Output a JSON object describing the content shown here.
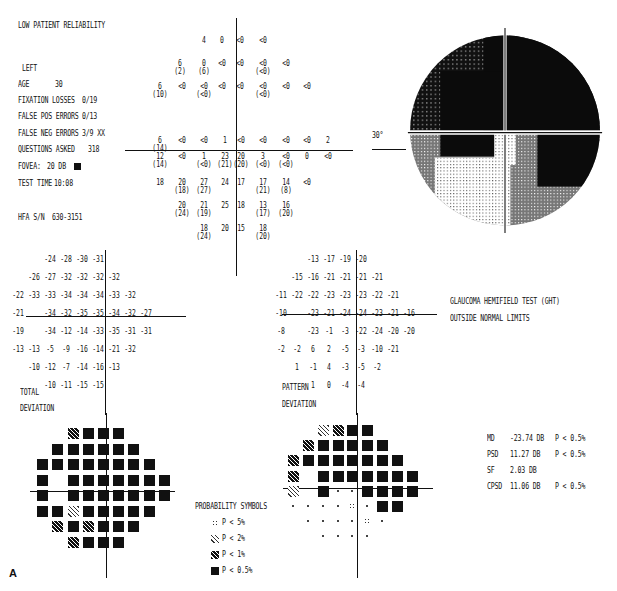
{
  "header": {
    "reliability": "LOW PATIENT RELIABILITY",
    "eye": "LEFT",
    "age_label": "AGE",
    "age": "30",
    "fixation_label": "FIXATION LOSSES",
    "fixation": "0/19",
    "falsepos_label": "FALSE POS ERRORS",
    "falsepos": "0/13",
    "falseneg_label": "FALSE NEG ERRORS",
    "falseneg": "3/9 XX",
    "questions_label": "QUESTIONS ASKED",
    "questions": "318",
    "fovea_label": "FOVEA:",
    "fovea": "20 DB",
    "testtime_label": "TEST TIME",
    "testtime": "10:08",
    "serial_label": "HFA S/N",
    "serial": "630-3151"
  },
  "grayscale": {
    "degree_label": "30°"
  },
  "threshold_rows": [
    {
      "y": 37,
      "cells": [
        {
          "x": 204,
          "v": "4"
        },
        {
          "x": 222,
          "v": "0"
        },
        {
          "x": 240,
          "v": "<0"
        },
        {
          "x": 263,
          "v": "<0"
        }
      ]
    },
    {
      "y": 60,
      "cells": [
        {
          "x": 180,
          "v": "6",
          "p": "(2)"
        },
        {
          "x": 204,
          "v": "0",
          "p": "(6)"
        },
        {
          "x": 222,
          "v": "<0"
        },
        {
          "x": 240,
          "v": "<0"
        },
        {
          "x": 263,
          "v": "<0",
          "p": "(<0)"
        },
        {
          "x": 286,
          "v": "<0"
        }
      ]
    },
    {
      "y": 83,
      "cells": [
        {
          "x": 160,
          "v": "6",
          "p": "(10)"
        },
        {
          "x": 182,
          "v": "<0"
        },
        {
          "x": 204,
          "v": "<0",
          "p": "(<0)"
        },
        {
          "x": 222,
          "v": "<0"
        },
        {
          "x": 240,
          "v": "<0"
        },
        {
          "x": 263,
          "v": "<0",
          "p": "(<0)"
        },
        {
          "x": 286,
          "v": "<0"
        },
        {
          "x": 307,
          "v": "<0"
        }
      ]
    },
    {
      "y": 137,
      "cells": [
        {
          "x": 160,
          "v": "6",
          "p": "(14)"
        },
        {
          "x": 182,
          "v": "<0"
        },
        {
          "x": 204,
          "v": "<0"
        },
        {
          "x": 225,
          "v": "1"
        },
        {
          "x": 241,
          "v": "<0"
        },
        {
          "x": 263,
          "v": "<0"
        },
        {
          "x": 286,
          "v": "<0"
        },
        {
          "x": 307,
          "v": "<0"
        },
        {
          "x": 328,
          "v": "2"
        }
      ]
    },
    {
      "y": 153,
      "cells": [
        {
          "x": 160,
          "v": "12",
          "p": "(14)"
        },
        {
          "x": 182,
          "v": "<0"
        },
        {
          "x": 204,
          "v": "1",
          "p": "(<0)"
        },
        {
          "x": 225,
          "v": "23",
          "p": "(21)"
        },
        {
          "x": 241,
          "v": "20",
          "p": "(20)"
        },
        {
          "x": 263,
          "v": "3",
          "p": "(<0)"
        },
        {
          "x": 286,
          "v": "<0",
          "p": "(<0)"
        },
        {
          "x": 307,
          "v": "0"
        },
        {
          "x": 328,
          "v": "<0"
        }
      ]
    },
    {
      "y": 179,
      "cells": [
        {
          "x": 160,
          "v": "18"
        },
        {
          "x": 182,
          "v": "20",
          "p": "(18)"
        },
        {
          "x": 204,
          "v": "27",
          "p": "(27)"
        },
        {
          "x": 225,
          "v": "24"
        },
        {
          "x": 241,
          "v": "17"
        },
        {
          "x": 263,
          "v": "17",
          "p": "(21)"
        },
        {
          "x": 286,
          "v": "14",
          "p": "(8)"
        },
        {
          "x": 307,
          "v": "<0"
        }
      ]
    },
    {
      "y": 202,
      "cells": [
        {
          "x": 182,
          "v": "20",
          "p": "(24)"
        },
        {
          "x": 204,
          "v": "21",
          "p": "(19)"
        },
        {
          "x": 225,
          "v": "25"
        },
        {
          "x": 241,
          "v": "18"
        },
        {
          "x": 263,
          "v": "13",
          "p": "(17)"
        },
        {
          "x": 286,
          "v": "16",
          "p": "(20)"
        }
      ]
    },
    {
      "y": 225,
      "cells": [
        {
          "x": 204,
          "v": "18",
          "p": "(24)"
        },
        {
          "x": 225,
          "v": "20"
        },
        {
          "x": 241,
          "v": "15"
        },
        {
          "x": 263,
          "v": "18",
          "p": "(20)"
        }
      ]
    }
  ],
  "total_deviation": {
    "label1": "TOTAL",
    "label2": "DEVIATION",
    "rows": [
      [
        "",
        "",
        "",
        "-24",
        "-28",
        "-30",
        "-31",
        "",
        "",
        ""
      ],
      [
        "",
        "",
        "-26",
        "-27",
        "-32",
        "-32",
        "-32",
        "-32",
        "",
        ""
      ],
      [
        "",
        "-22",
        "-33",
        "-33",
        "-34",
        "-34",
        "-34",
        "-33",
        "-32",
        ""
      ],
      [
        "",
        "-21",
        "",
        "-34",
        "-32",
        "-35",
        "-35",
        "-34",
        "-32",
        "-27"
      ],
      [
        "",
        "-19",
        "",
        "-34",
        "-12",
        "-14",
        "-33",
        "-35",
        "-31",
        "-31"
      ],
      [
        "",
        "-13",
        "-13",
        "-5",
        "-9",
        "-16",
        "-14",
        "-21",
        "-32",
        ""
      ],
      [
        "",
        "",
        "-10",
        "-12",
        "-7",
        "-14",
        "-16",
        "-13",
        "",
        ""
      ],
      [
        "",
        "",
        "",
        "-10",
        "-11",
        "-15",
        "-15",
        "",
        "",
        ""
      ]
    ]
  },
  "pattern_deviation": {
    "label1": "PATTERN",
    "label2": "DEVIATION",
    "rows": [
      [
        "",
        "",
        "",
        "-13",
        "-17",
        "-19",
        "-20",
        "",
        "",
        ""
      ],
      [
        "",
        "",
        "-15",
        "-16",
        "-21",
        "-21",
        "-21",
        "-21",
        "",
        ""
      ],
      [
        "",
        "-11",
        "-22",
        "-22",
        "-23",
        "-23",
        "-23",
        "-22",
        "-21",
        ""
      ],
      [
        "",
        "-10",
        "",
        "-23",
        "-21",
        "-24",
        "-24",
        "-23",
        "-21",
        "-16"
      ],
      [
        "",
        "-8",
        "",
        "-23",
        "-1",
        "-3",
        "-22",
        "-24",
        "-20",
        "-20"
      ],
      [
        "",
        "-2",
        "-2",
        "6",
        "2",
        "-5",
        "-3",
        "-10",
        "-21",
        ""
      ],
      [
        "",
        "",
        "1",
        "-1",
        "4",
        "-3",
        "-5",
        "-2",
        "",
        ""
      ],
      [
        "",
        "",
        "",
        "1",
        "0",
        "-4",
        "-4",
        "",
        "",
        ""
      ]
    ]
  },
  "ght": {
    "line1": "GLAUCOMA HEMIFIELD TEST (GHT)",
    "line2": "OUTSIDE NORMAL LIMITS"
  },
  "indices": [
    {
      "name": "MD",
      "value": "-23.74 DB",
      "p": "P < 0.5%"
    },
    {
      "name": "PSD",
      "value": "11.27 DB",
      "p": "P < 0.5%"
    },
    {
      "name": "SF",
      "value": "2.03 DB",
      "p": ""
    },
    {
      "name": "CPSD",
      "value": "11.06 DB",
      "p": "P < 0.5%"
    }
  ],
  "legend": {
    "title": "PROBABILITY SYMBOLS",
    "items": [
      {
        "sym": "s5",
        "label": "P <  5%"
      },
      {
        "sym": "s2",
        "label": "P <  2%"
      },
      {
        "sym": "s1",
        "label": "P <  1%"
      },
      {
        "sym": "s05",
        "label": "P < 0.5%"
      }
    ]
  },
  "td_prob": [
    [
      "",
      "",
      "",
      "s1",
      "s05",
      "s05",
      "s05",
      "",
      "",
      ""
    ],
    [
      "",
      "",
      "s05",
      "s05",
      "s05",
      "s05",
      "s05",
      "s05",
      "",
      ""
    ],
    [
      "",
      "s05",
      "s05",
      "s05",
      "s05",
      "s05",
      "s05",
      "s05",
      "s05",
      ""
    ],
    [
      "",
      "s05",
      "",
      "s05",
      "s05",
      "s05",
      "s05",
      "s05",
      "s05",
      "s05"
    ],
    [
      "",
      "s05",
      "",
      "s05",
      "s05",
      "s05",
      "s05",
      "s05",
      "s05",
      "s05"
    ],
    [
      "",
      "s05",
      "s05",
      "s2",
      "s05",
      "s05",
      "s05",
      "s05",
      "s05",
      ""
    ],
    [
      "",
      "",
      "s1",
      "s05",
      "s1",
      "s05",
      "s05",
      "s05",
      "",
      ""
    ],
    [
      "",
      "",
      "",
      "s1",
      "s05",
      "s05",
      "s05",
      "",
      "",
      ""
    ]
  ],
  "pd_prob": [
    [
      "",
      "",
      "",
      "s2",
      "s1",
      "s05",
      "s05",
      "",
      "",
      ""
    ],
    [
      "",
      "",
      "s1",
      "s05",
      "s05",
      "s05",
      "s05",
      "s05",
      "",
      ""
    ],
    [
      "",
      "s1",
      "s05",
      "s05",
      "s05",
      "s05",
      "s05",
      "s05",
      "s05",
      ""
    ],
    [
      "",
      "s1",
      "",
      "s05",
      "s05",
      "s05",
      "s05",
      "s05",
      "s05",
      "s05"
    ],
    [
      "",
      "s2",
      "",
      "s05",
      "dot",
      "dot",
      "s05",
      "s05",
      "s05",
      "s05"
    ],
    [
      "",
      "dot",
      "dot",
      "dot",
      "dot",
      "s5",
      "dot",
      "s05",
      "s05",
      ""
    ],
    [
      "",
      "",
      "dot",
      "dot",
      "dot",
      "dot",
      "s5",
      "dot",
      "",
      ""
    ],
    [
      "",
      "",
      "",
      "dot",
      "dot",
      "dot",
      "dot",
      "",
      "",
      ""
    ]
  ],
  "figure_label": "A"
}
